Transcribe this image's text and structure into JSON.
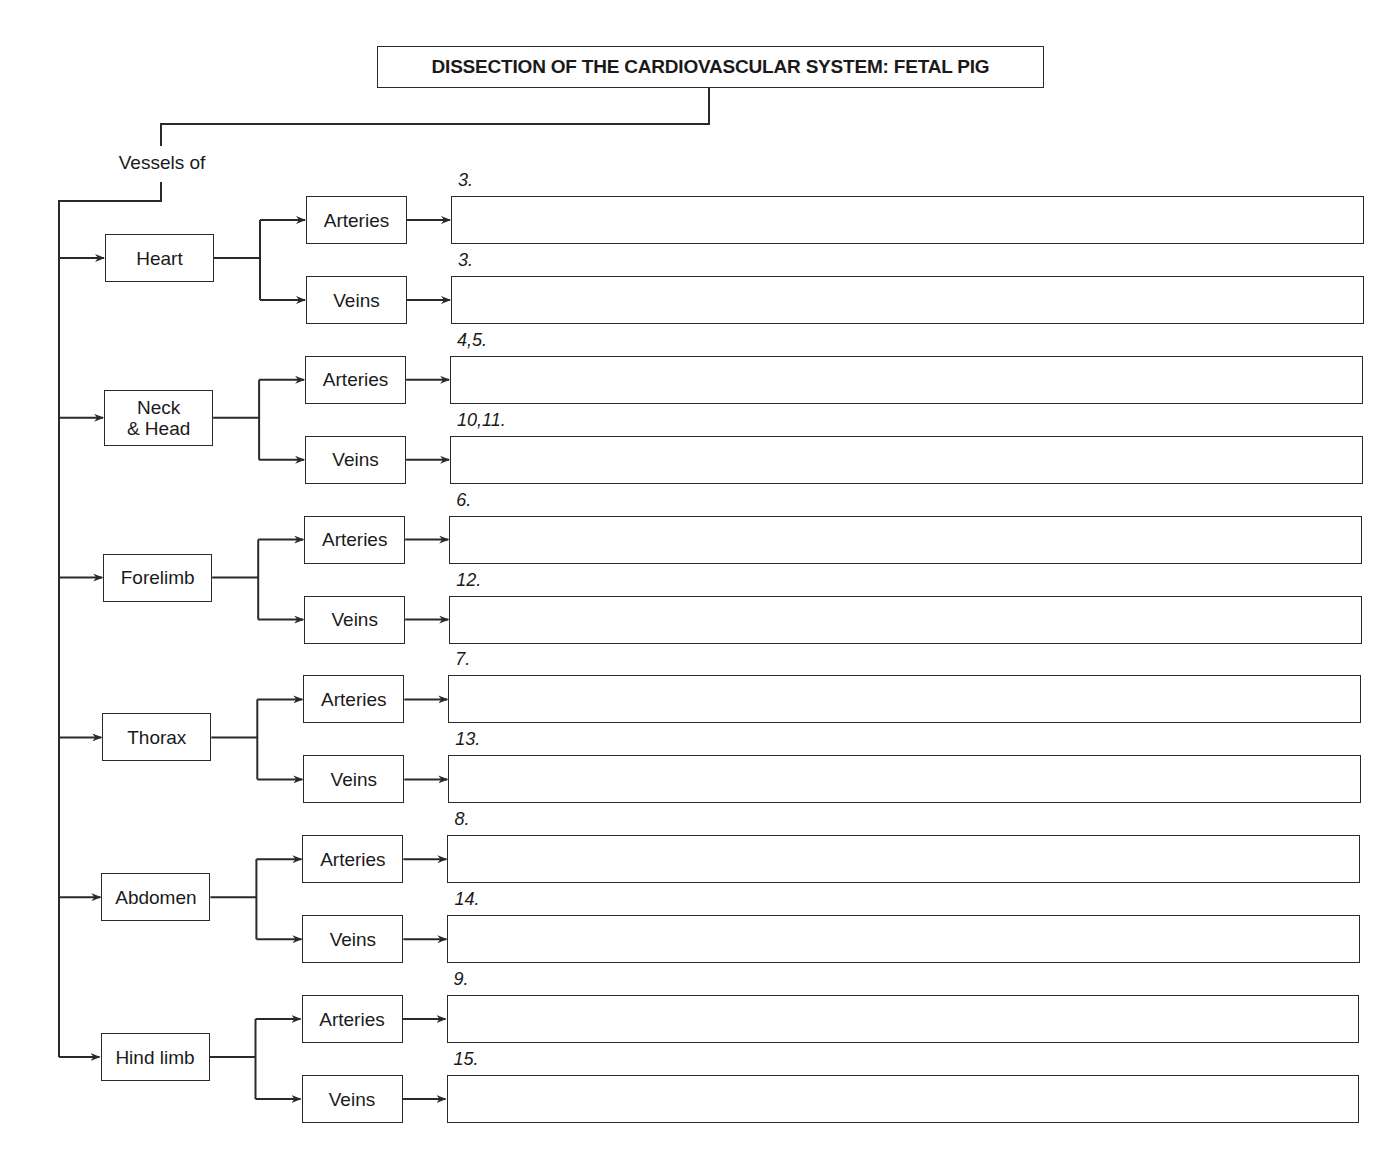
{
  "title": "DISSECTION OF THE CARDIOVASCULAR SYSTEM: FETAL PIG",
  "root_label": "Vessels of",
  "regions": [
    {
      "label": "Heart",
      "arteries_label": "Arteries",
      "veins_label": "Veins",
      "arteries_number": "3.",
      "veins_number": "3."
    },
    {
      "label": "Neck\n& Head",
      "arteries_label": "Arteries",
      "veins_label": "Veins",
      "arteries_number": "4,5.",
      "veins_number": "10,11."
    },
    {
      "label": "Forelimb",
      "arteries_label": "Arteries",
      "veins_label": "Veins",
      "arteries_number": "6.",
      "veins_number": "12."
    },
    {
      "label": "Thorax",
      "arteries_label": "Arteries",
      "veins_label": "Veins",
      "arteries_number": "7.",
      "veins_number": "13."
    },
    {
      "label": "Abdomen",
      "arteries_label": "Arteries",
      "veins_label": "Veins",
      "arteries_number": "8.",
      "veins_number": "14."
    },
    {
      "label": "Hind limb",
      "arteries_label": "Arteries",
      "veins_label": "Veins",
      "arteries_number": "9.",
      "veins_number": "15."
    }
  ],
  "colors": {
    "line": "#2a2a2a",
    "background": "#ffffff"
  }
}
